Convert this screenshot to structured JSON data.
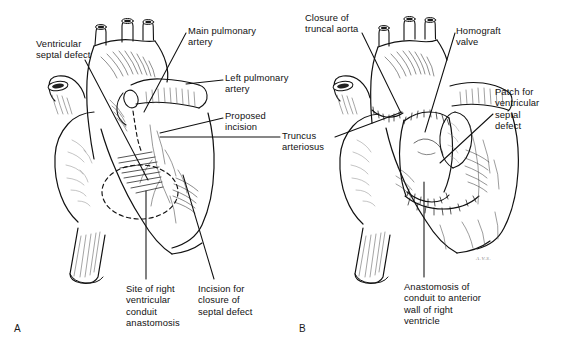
{
  "figure": {
    "background_color": "#ffffff",
    "ink_color": "#111111",
    "signature": "A.V.S."
  },
  "panels": [
    {
      "id": "A",
      "letter": "A",
      "caption": "Preoperative anatomy with planned incisions",
      "labels": [
        {
          "name": "ventricular-septal-defect",
          "text": "Ventricular\nseptal defect",
          "x": 36,
          "y": 38,
          "align": "left"
        },
        {
          "name": "main-pulmonary-artery",
          "text": "Main pulmonary\nartery",
          "x": 188,
          "y": 25,
          "align": "left"
        },
        {
          "name": "left-pulmonary-artery",
          "text": "Left pulmonary\nartery",
          "x": 225,
          "y": 72,
          "align": "left"
        },
        {
          "name": "proposed-incision",
          "text": "Proposed\nincision",
          "x": 225,
          "y": 110,
          "align": "left"
        },
        {
          "name": "site-of-right-ventricular-conduit-anastomosis",
          "text": "Site of right\nventricular\nconduit\nanastomosis",
          "x": 126,
          "y": 283,
          "align": "left"
        },
        {
          "name": "incision-for-closure-of-septal-defect",
          "text": "Incision for\nclosure of\nseptal defect",
          "x": 198,
          "y": 283,
          "align": "left"
        }
      ]
    },
    {
      "id": "B",
      "letter": "B",
      "caption": "Completed repair with homograft conduit and VSD patch",
      "labels": [
        {
          "name": "closure-of-truncal-aorta",
          "text": "Closure of\ntruncal aorta",
          "x": 305,
          "y": 12,
          "align": "left"
        },
        {
          "name": "homograft-valve",
          "text": "Homograft\nvalve",
          "x": 456,
          "y": 25,
          "align": "left"
        },
        {
          "name": "patch-for-ventricular-septal-defect",
          "text": "Patch for\nventricular\nseptal\ndefect",
          "x": 495,
          "y": 86,
          "align": "left"
        },
        {
          "name": "anastomosis-of-conduit-to-anterior-wall-of-right-ventricle",
          "text": "Anastomosis of\nconduit to anterior\nwall of right\nventricle",
          "x": 404,
          "y": 281,
          "align": "left"
        }
      ]
    }
  ],
  "shared_labels": [
    {
      "name": "truncus-arteriosus",
      "text": "Truncus\narteriosus",
      "x": 282,
      "y": 130,
      "align": "left"
    }
  ],
  "panel_letters": [
    {
      "name": "panel-letter-a",
      "text": "A",
      "x": 14,
      "y": 323
    },
    {
      "name": "panel-letter-b",
      "text": "B",
      "x": 299,
      "y": 323
    }
  ]
}
